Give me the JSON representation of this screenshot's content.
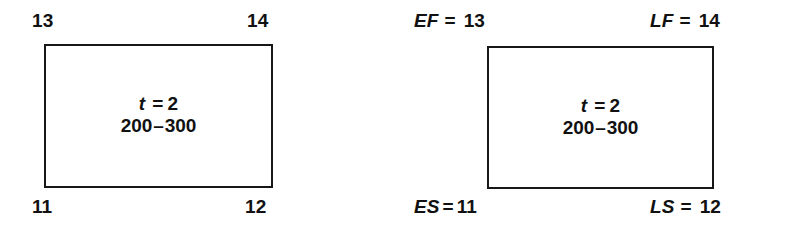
{
  "diagrams": [
    {
      "id": "plain-activity-node",
      "corner_labels": {
        "top_left": {
          "text": "13"
        },
        "top_right": {
          "text": "14"
        },
        "bottom_left": {
          "text": "11"
        },
        "bottom_right": {
          "text": "12"
        }
      },
      "center": {
        "duration_variable": "t",
        "duration_equals": "=",
        "duration_value": "2",
        "range_start": "200",
        "range_dash": "–",
        "range_end": "300"
      }
    },
    {
      "id": "labeled-activity-node",
      "corner_labels": {
        "top_left": {
          "var": "EF",
          "equals": "=",
          "value": "13"
        },
        "top_right": {
          "var": "LF",
          "equals": "=",
          "value": "14"
        },
        "bottom_left": {
          "var": "ES",
          "equals": "=",
          "value": "11"
        },
        "bottom_right": {
          "var": "LS",
          "equals": "=",
          "value": "12"
        }
      },
      "center": {
        "duration_variable": "t",
        "duration_equals": "=",
        "duration_value": "2",
        "range_start": "200",
        "range_dash": "–",
        "range_end": "300"
      }
    }
  ],
  "colors": {
    "background": "#ffffff",
    "ink": "#171717"
  }
}
